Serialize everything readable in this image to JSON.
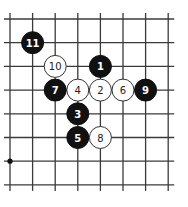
{
  "diagram": {
    "type": "go-board-fragment",
    "columns": 8,
    "rows": 8,
    "colors": {
      "line": "#3a3a3a",
      "black_stone": "#111111",
      "white_stone": "#ffffff",
      "white_stone_outline": "#333333",
      "background": "#ffffff"
    },
    "star_points": [
      {
        "col": 0,
        "row": 6
      }
    ],
    "stones": [
      {
        "move": "1",
        "color": "black",
        "col": 4,
        "row": 2
      },
      {
        "move": "2",
        "color": "white",
        "col": 4,
        "row": 3
      },
      {
        "move": "3",
        "color": "black",
        "col": 3,
        "row": 4
      },
      {
        "move": "4",
        "color": "white",
        "col": 3,
        "row": 3
      },
      {
        "move": "5",
        "color": "black",
        "col": 3,
        "row": 5
      },
      {
        "move": "6",
        "color": "white",
        "col": 5,
        "row": 3
      },
      {
        "move": "7",
        "color": "black",
        "col": 2,
        "row": 3
      },
      {
        "move": "8",
        "color": "white",
        "col": 4,
        "row": 5
      },
      {
        "move": "9",
        "color": "black",
        "col": 6,
        "row": 3
      },
      {
        "move": "10",
        "color": "white",
        "col": 2,
        "row": 2
      },
      {
        "move": "11",
        "color": "black",
        "col": 1,
        "row": 1
      }
    ]
  }
}
